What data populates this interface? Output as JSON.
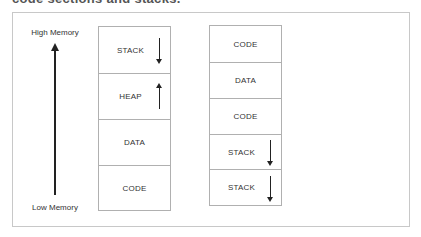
{
  "heading": "code sections and stacks.",
  "diagram": {
    "high_label": "High Memory",
    "low_label": "Low Memory",
    "left_column": [
      {
        "label": "STACK",
        "arrow": "down"
      },
      {
        "label": "HEAP",
        "arrow": "up"
      },
      {
        "label": "DATA",
        "arrow": "none"
      },
      {
        "label": "CODE",
        "arrow": "none"
      }
    ],
    "right_column": [
      {
        "label": "CODE",
        "arrow": "none"
      },
      {
        "label": "DATA",
        "arrow": "none"
      },
      {
        "label": "CODE",
        "arrow": "none"
      },
      {
        "label": "STACK",
        "arrow": "down"
      },
      {
        "label": "STACK",
        "arrow": "down"
      }
    ]
  }
}
